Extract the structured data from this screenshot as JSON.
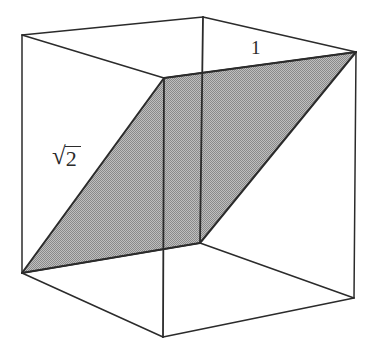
{
  "figure": {
    "type": "geometric-diagram",
    "background_color": "#ffffff",
    "edge_color": "#2b2b2b",
    "shaded_fill_color": "#a3a3a3",
    "shaded_fill_pattern": "halftone-dither-gray",
    "labels": {
      "diagonal_label_radical": "√",
      "diagonal_label_radicand": "2",
      "diagonal_label_full": "√2",
      "edge_label": "1"
    },
    "cube_vertices": {
      "back_top_left": [
        22,
        35
      ],
      "back_top_right": [
        203,
        17
      ],
      "front_top_left": [
        164,
        78
      ],
      "front_top_right": [
        356,
        52
      ],
      "back_bottom_left": [
        22,
        273
      ],
      "back_bottom_right": [
        200,
        243
      ],
      "front_bottom_left": [
        163,
        337
      ],
      "front_bottom_right": [
        354,
        298
      ]
    },
    "shaded_plane_vertices": [
      [
        22,
        273
      ],
      [
        164,
        78
      ],
      [
        356,
        52
      ],
      [
        200,
        243
      ]
    ]
  }
}
